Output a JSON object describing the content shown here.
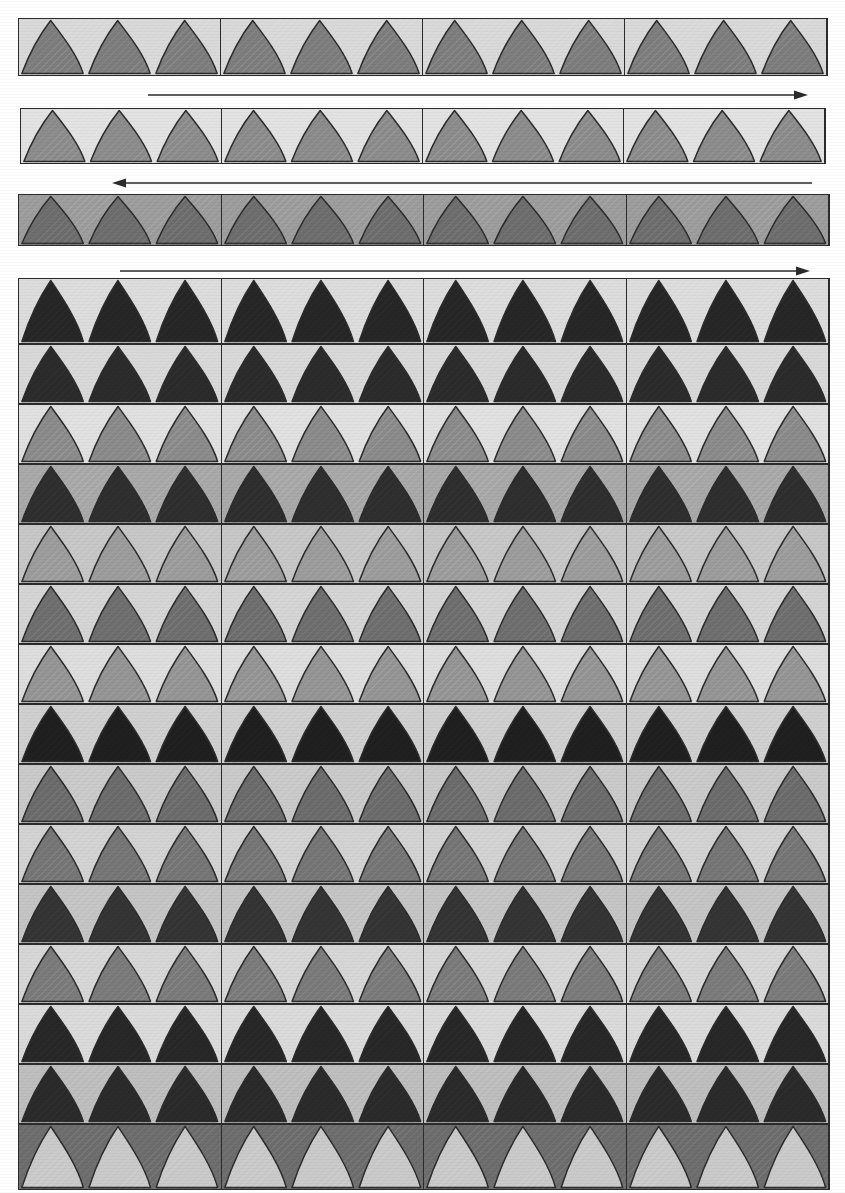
{
  "figure": {
    "canvas": {
      "width": 845,
      "height": 1193,
      "background": "#ffffff"
    },
    "palette": {
      "ink": "#2b2b2b",
      "black": "#262626",
      "near_black": "#2f2f2f",
      "dark_gray": "#4a4a4a",
      "mid_dark_gray": "#5e5e5e",
      "mid_gray": "#6f6f6f",
      "gray": "#808080",
      "light_gray": "#9a9a9a",
      "pale_gray": "#b8b8b8",
      "paper": "#d9d9d9",
      "paper_light": "#e2e2e2",
      "paper_lighter": "#e8e8e8",
      "white_page": "#ffffff"
    },
    "columns": 4,
    "triangles_per_segment": 3
  },
  "top_bands": [
    {
      "id": "band-1",
      "label": "Band 1",
      "x": 18,
      "y": 18,
      "width": 810,
      "height": 58,
      "background": "#d9d9d9",
      "triangle_fill": "#7d7d7d",
      "orientation": "up",
      "segments": 4,
      "triangles_per_segment": 3,
      "wide_base": true
    },
    {
      "id": "band-2",
      "label": "Band 2",
      "x": 20,
      "y": 108,
      "width": 806,
      "height": 56,
      "background": "#e2e2e2",
      "triangle_fill": "#8b8b8b",
      "orientation": "up",
      "segments": 4,
      "triangles_per_segment": 3,
      "wide_base": true
    },
    {
      "id": "band-3",
      "label": "Band 3",
      "x": 18,
      "y": 194,
      "width": 812,
      "height": 52,
      "background": "#9c9c9c",
      "triangle_fill": "#6d6d6d",
      "orientation": "up",
      "segments": 4,
      "triangles_per_segment": 3,
      "wide_base": true
    }
  ],
  "arrows": [
    {
      "id": "arrow-1",
      "label": "Arrow 1 — left to right",
      "direction": "right",
      "x": 148,
      "y": 88,
      "length": 660,
      "color": "#2b2b2b"
    },
    {
      "id": "arrow-2",
      "label": "Arrow 2 — right to left",
      "direction": "left",
      "x": 112,
      "y": 176,
      "length": 700,
      "color": "#2b2b2b"
    },
    {
      "id": "arrow-3",
      "label": "Arrow 3 — left to right",
      "direction": "right",
      "x": 120,
      "y": 264,
      "length": 690,
      "color": "#2b2b2b"
    }
  ],
  "grid": {
    "label": "Main motif grid",
    "x": 18,
    "y": 278,
    "width": 812,
    "height": 910,
    "row_count": 15,
    "column_count": 4,
    "triangles_per_segment": 3,
    "rows": [
      {
        "index": 1,
        "label": "Row 1",
        "background": "#dcdcdc",
        "triangle_fill": "#262626",
        "orientation": "up",
        "height": 64
      },
      {
        "index": 2,
        "label": "Row 2",
        "background": "#d8d8d8",
        "triangle_fill": "#2b2b2b",
        "orientation": "up",
        "height": 58
      },
      {
        "index": 3,
        "label": "Row 3",
        "background": "#e0e0e0",
        "triangle_fill": "#8a8a8a",
        "orientation": "up",
        "height": 58
      },
      {
        "index": 4,
        "label": "Row 4",
        "background": "#a8a8a8",
        "triangle_fill": "#2e2e2e",
        "orientation": "up",
        "height": 58
      },
      {
        "index": 5,
        "label": "Row 5",
        "background": "#c6c6c6",
        "triangle_fill": "#9b9b9b",
        "orientation": "up",
        "height": 58
      },
      {
        "index": 6,
        "label": "Row 6",
        "background": "#d4d4d4",
        "triangle_fill": "#6e6e6e",
        "orientation": "up",
        "height": 58
      },
      {
        "index": 7,
        "label": "Row 7",
        "background": "#dddddd",
        "triangle_fill": "#949494",
        "orientation": "up",
        "height": 58
      },
      {
        "index": 8,
        "label": "Row 8",
        "background": "#cfcfcf",
        "triangle_fill": "#1f1f1f",
        "orientation": "up",
        "height": 58
      },
      {
        "index": 9,
        "label": "Row 9",
        "background": "#c9c9c9",
        "triangle_fill": "#6b6b6b",
        "orientation": "up",
        "height": 58
      },
      {
        "index": 10,
        "label": "Row 10",
        "background": "#d2d2d2",
        "triangle_fill": "#757575",
        "orientation": "up",
        "height": 58
      },
      {
        "index": 11,
        "label": "Row 11",
        "background": "#c4c4c4",
        "triangle_fill": "#343434",
        "orientation": "up",
        "height": 58
      },
      {
        "index": 12,
        "label": "Row 12",
        "background": "#d6d6d6",
        "triangle_fill": "#7a7a7a",
        "orientation": "up",
        "height": 58
      },
      {
        "index": 13,
        "label": "Row 13",
        "background": "#dadada",
        "triangle_fill": "#272727",
        "orientation": "up",
        "height": 58
      },
      {
        "index": 14,
        "label": "Row 14",
        "background": "#bdbdbd",
        "triangle_fill": "#2a2a2a",
        "orientation": "up",
        "height": 58
      },
      {
        "index": 15,
        "label": "Row 15",
        "background": "#6d6d6d",
        "triangle_fill": "#c9c9c9",
        "orientation": "up",
        "height": 64
      }
    ]
  }
}
